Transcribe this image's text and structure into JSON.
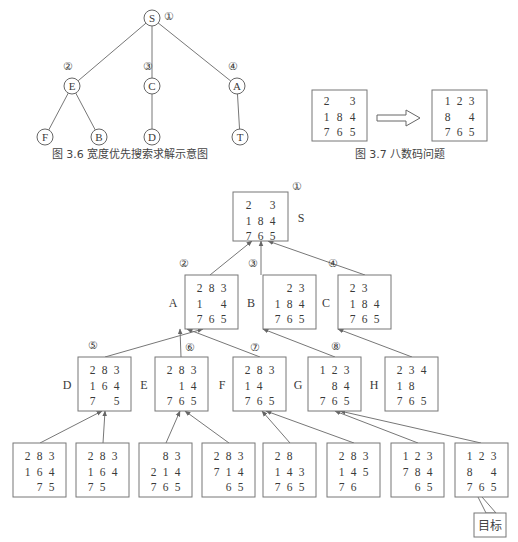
{
  "figure_3_6": {
    "caption": "图 3.6   宽度优先搜索求解示意图",
    "nodes": [
      {
        "id": "S",
        "label": "S",
        "order": "①"
      },
      {
        "id": "E",
        "label": "E",
        "order": "②"
      },
      {
        "id": "C",
        "label": "C",
        "order": "③"
      },
      {
        "id": "A",
        "label": "A",
        "order": "④"
      },
      {
        "id": "F",
        "label": "F"
      },
      {
        "id": "B",
        "label": "B"
      },
      {
        "id": "D",
        "label": "D"
      },
      {
        "id": "T",
        "label": "T"
      }
    ],
    "edges": [
      [
        "S",
        "E"
      ],
      [
        "S",
        "C"
      ],
      [
        "S",
        "A"
      ],
      [
        "E",
        "F"
      ],
      [
        "E",
        "B"
      ],
      [
        "C",
        "D"
      ],
      [
        "A",
        "T"
      ]
    ]
  },
  "figure_3_7": {
    "caption": "图 3.7   八数码问题",
    "initial": [
      [
        "2",
        " ",
        "3"
      ],
      [
        "1",
        "8",
        "4"
      ],
      [
        "7",
        "6",
        "5"
      ]
    ],
    "goal": [
      [
        "1",
        "2",
        "3"
      ],
      [
        "8",
        " ",
        "4"
      ],
      [
        "7",
        "6",
        "5"
      ]
    ],
    "arrow": "hollow-right-arrow"
  },
  "search_tree": {
    "root": {
      "label": "S",
      "order": "①",
      "grid": [
        [
          "2",
          " ",
          "3"
        ],
        [
          "1",
          "8",
          "4"
        ],
        [
          "7",
          "6",
          "5"
        ]
      ]
    },
    "level2": [
      {
        "label": "A",
        "order": "②",
        "grid": [
          [
            "2",
            "8",
            "3"
          ],
          [
            "1",
            " ",
            "4"
          ],
          [
            "7",
            "6",
            "5"
          ]
        ]
      },
      {
        "label": "B",
        "order": "③",
        "grid": [
          [
            " ",
            "2",
            "3"
          ],
          [
            "1",
            "8",
            "4"
          ],
          [
            "7",
            "6",
            "5"
          ]
        ]
      },
      {
        "label": "C",
        "order": "④",
        "grid": [
          [
            "2",
            "3",
            " "
          ],
          [
            "1",
            "8",
            "4"
          ],
          [
            "7",
            "6",
            "5"
          ]
        ]
      }
    ],
    "level3": [
      {
        "label": "D",
        "order": "⑤",
        "grid": [
          [
            "2",
            "8",
            "3"
          ],
          [
            "1",
            "6",
            "4"
          ],
          [
            "7",
            " ",
            "5"
          ]
        ]
      },
      {
        "label": "E",
        "order": "⑥",
        "grid": [
          [
            "2",
            "8",
            "3"
          ],
          [
            " ",
            "1",
            "4"
          ],
          [
            "7",
            "6",
            "5"
          ]
        ]
      },
      {
        "label": "F",
        "order": "⑦",
        "grid": [
          [
            "2",
            "8",
            "3"
          ],
          [
            "1",
            "4",
            " "
          ],
          [
            "7",
            "6",
            "5"
          ]
        ]
      },
      {
        "label": "G",
        "order": "⑧",
        "grid": [
          [
            "1",
            "2",
            "3"
          ],
          [
            " ",
            "8",
            "4"
          ],
          [
            "7",
            "6",
            "5"
          ]
        ]
      },
      {
        "label": "H",
        "order": "",
        "grid": [
          [
            "2",
            "3",
            "4"
          ],
          [
            "1",
            "8",
            " "
          ],
          [
            "7",
            "6",
            "5"
          ]
        ]
      }
    ],
    "level4": [
      {
        "grid": [
          [
            "2",
            "8",
            "3"
          ],
          [
            "1",
            "6",
            "4"
          ],
          [
            " ",
            "7",
            "5"
          ]
        ]
      },
      {
        "grid": [
          [
            "2",
            "8",
            "3"
          ],
          [
            "1",
            "6",
            "4"
          ],
          [
            "7",
            "5",
            " "
          ]
        ]
      },
      {
        "grid": [
          [
            " ",
            "8",
            "3"
          ],
          [
            "2",
            "1",
            "4"
          ],
          [
            "7",
            "6",
            "5"
          ]
        ]
      },
      {
        "grid": [
          [
            "2",
            "8",
            "3"
          ],
          [
            "7",
            "1",
            "4"
          ],
          [
            " ",
            "6",
            "5"
          ]
        ]
      },
      {
        "grid": [
          [
            "2",
            "8",
            " "
          ],
          [
            "1",
            "4",
            "3"
          ],
          [
            "7",
            "6",
            "5"
          ]
        ]
      },
      {
        "grid": [
          [
            "2",
            "8",
            "3"
          ],
          [
            "1",
            "4",
            "5"
          ],
          [
            "7",
            "6",
            " "
          ]
        ]
      },
      {
        "grid": [
          [
            "1",
            "2",
            "3"
          ],
          [
            "7",
            "8",
            "4"
          ],
          [
            " ",
            "6",
            "5"
          ]
        ]
      },
      {
        "grid": [
          [
            "1",
            "2",
            "3"
          ],
          [
            "8",
            " ",
            "4"
          ],
          [
            "7",
            "6",
            "5"
          ]
        ]
      }
    ],
    "goal_label": "目标"
  },
  "colors": {
    "line": "#777777",
    "text": "#3a3a3a",
    "background": "#ffffff"
  }
}
